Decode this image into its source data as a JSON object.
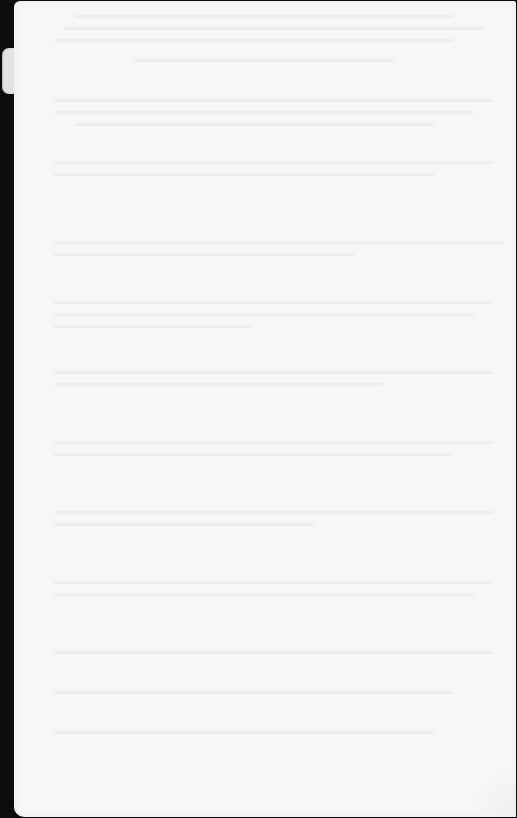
{
  "document": {
    "type": "scanned page",
    "content": "",
    "note": "blank page with faint reverse-side show-through; no legible text"
  },
  "colors": {
    "page": "#f7f7f5",
    "scanner_background": "#0c0c0c",
    "tab": "#e4e4e2"
  }
}
